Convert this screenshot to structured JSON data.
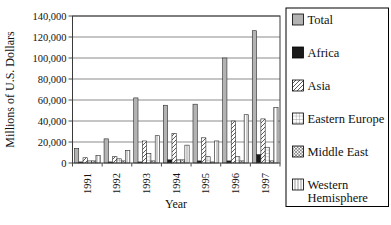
{
  "chart_data": {
    "type": "bar",
    "title": "",
    "xlabel": "Year",
    "ylabel": "Millions of U.S. Dollars",
    "ylim": [
      0,
      140000
    ],
    "y_tick_step": 20000,
    "y_tick_labels": [
      "0",
      "20,000",
      "40,000",
      "60,000",
      "80,000",
      "100,000",
      "120,000",
      "140,000"
    ],
    "categories": [
      "1991",
      "1992",
      "1993",
      "1994",
      "1995",
      "1996",
      "1997"
    ],
    "series": [
      {
        "name": "Total",
        "pattern": "solid-gray",
        "values": [
          14000,
          23000,
          62000,
          55000,
          56000,
          100000,
          126000
        ]
      },
      {
        "name": "Africa",
        "pattern": "solid-black",
        "values": [
          1000,
          1000,
          1000,
          3000,
          2000,
          2000,
          8000
        ]
      },
      {
        "name": "Asia",
        "pattern": "diagonal",
        "values": [
          5000,
          6000,
          21000,
          28000,
          24000,
          40000,
          42000
        ]
      },
      {
        "name": "Eastern Europe",
        "pattern": "grid",
        "values": [
          2000,
          4000,
          9000,
          3000,
          6000,
          6000,
          15000
        ]
      },
      {
        "name": "Middle East",
        "pattern": "crosshatch",
        "values": [
          2000,
          2000,
          2000,
          3000,
          1000,
          2000,
          2000
        ]
      },
      {
        "name": "Western Hemisphere",
        "pattern": "vertical",
        "values": [
          7000,
          12000,
          26000,
          17000,
          21000,
          46000,
          53000
        ]
      }
    ],
    "grid": true,
    "legend_position": "right"
  },
  "colors": {
    "background": "#ffffff",
    "bar_gray": "#b3b3b3",
    "bar_black": "#1a1a1a",
    "pattern_stroke": "#333333",
    "axis": "#3a3a3a",
    "gridline": "#5a5a5a",
    "legend_border": "#000000"
  }
}
